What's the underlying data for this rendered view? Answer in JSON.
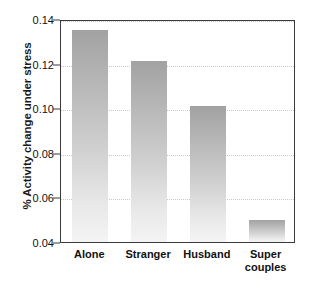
{
  "chart_data": {
    "type": "bar",
    "title": "",
    "xlabel": "",
    "ylabel": "% Activity change under stress",
    "categories": [
      "Alone",
      "Stranger",
      "Husband",
      "Super\ncouples"
    ],
    "category_labels_flat": [
      "Alone",
      "Stranger",
      "Husband",
      "Super couples"
    ],
    "values": [
      0.135,
      0.121,
      0.101,
      0.05
    ],
    "ylim": [
      0.04,
      0.14
    ],
    "ytick_values": [
      0.04,
      0.06,
      0.08,
      0.1,
      0.12,
      0.14
    ],
    "ytick_labels": [
      "0.04",
      "0.06",
      "0.08",
      "0.10",
      "0.12",
      "0.14"
    ],
    "gridlines": true,
    "gridline_values": [
      0.06,
      0.08,
      0.1,
      0.12,
      0.14
    ],
    "legend": null,
    "bar_color_top": "#a2a2a2",
    "bar_color_bottom": "#f4f4f4",
    "axis_color": "#3a3a3a",
    "grid_color": "#c9c9c9",
    "text_color": "#111111",
    "background": "#ffffff"
  }
}
